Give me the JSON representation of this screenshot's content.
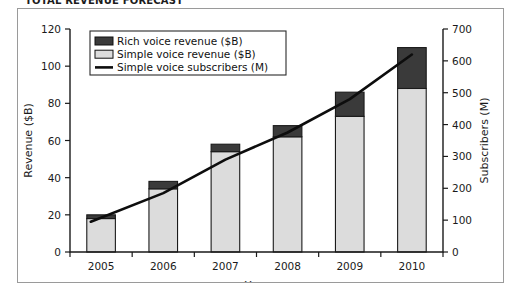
{
  "figure": {
    "title_partial": "TOTAL REVENUE FORECAST",
    "border_color": "#9a9a9a",
    "background": "#ffffff"
  },
  "chart_data": {
    "type": "bar",
    "title": "",
    "xlabel": "Year",
    "ylabel": "Revenue ($B)",
    "y2label": "Subscribers (M)",
    "categories": [
      "2005",
      "2006",
      "2007",
      "2008",
      "2009",
      "2010"
    ],
    "ylim": [
      0,
      120
    ],
    "yticks": [
      0,
      20,
      40,
      60,
      80,
      100,
      120
    ],
    "y2lim": [
      0,
      700
    ],
    "y2ticks": [
      0,
      100,
      200,
      300,
      400,
      500,
      600,
      700
    ],
    "grid": false,
    "stacked": true,
    "legend_position": "upper left",
    "series": [
      {
        "name": "Simple voice revenue ($B)",
        "type": "bar",
        "axis": "left",
        "color": "#dcdcdc",
        "values": [
          18,
          34,
          54,
          62,
          73,
          88
        ]
      },
      {
        "name": "Rich voice revenue ($B)",
        "type": "bar",
        "axis": "left",
        "color": "#3a3a3a",
        "values": [
          2,
          4,
          4,
          6,
          13,
          22
        ]
      },
      {
        "name": "Simple voice subscribers (M)",
        "type": "line",
        "axis": "right",
        "color": "#0d0d0d",
        "values": [
          95,
          185,
          290,
          375,
          480,
          620
        ]
      }
    ],
    "legend_entries": [
      "Rich voice revenue ($B)",
      "Simple voice revenue ($B)",
      "Simple voice subscribers (M)"
    ]
  }
}
